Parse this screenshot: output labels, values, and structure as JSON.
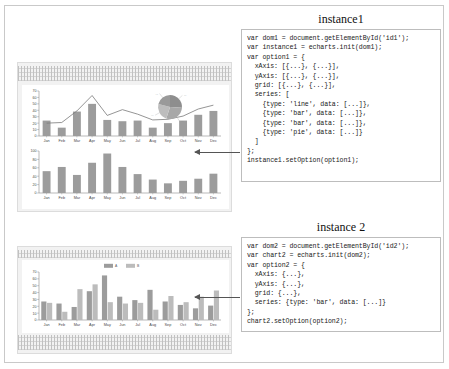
{
  "instances": [
    {
      "title": "instance1",
      "code": "var dom1 = document.getElementById('id1');\nvar instance1 = echarts.init(dom1);\nvar option1 = {\n  xAxis: [{...}, {...}],\n  yAxis: [{...}, {...}],\n  grid: [{...}, {...}],\n  series: [\n    {type: 'line', data: [...]},\n    {type: 'bar', data: [...]},\n    {type: 'bar', data: [...]},\n    {type: 'pie', data: [...]}\n  ]\n};\ninstance1.setOption(option1);"
    },
    {
      "title": "instance 2",
      "code": "var dom2 = document.getElementById('id2');\nvar chart2 = echarts.init(dom2);\nvar option2 = {\n  xAxis: {...},\n  yAxis: {...},\n  grid: {...},\n  series: {type: 'bar', data: [...]}\n};\nchart2.setOption(option2);"
    }
  ],
  "arrows": [
    {
      "name": "arrow-to-instance1-chart"
    },
    {
      "name": "arrow-to-instance2-chart"
    }
  ],
  "chart_data": [
    {
      "id": "instance1-upper",
      "type": "bar",
      "title": "",
      "xlabel": "",
      "ylabel": "",
      "categories": [
        "Jan",
        "Feb",
        "Mar",
        "Apr",
        "May",
        "Jun",
        "Jul",
        "Aug",
        "Sep",
        "Oct",
        "Nov",
        "Dec"
      ],
      "ytick_labels": [
        "0",
        "10",
        "20",
        "30",
        "40",
        "50",
        "60",
        "70"
      ],
      "ylim": [
        0,
        70
      ],
      "grid": false,
      "legend": "none",
      "series": [
        {
          "name": "bar",
          "type": "bar",
          "values": [
            24,
            13,
            38,
            50,
            25,
            23,
            24,
            13,
            20,
            24,
            33,
            39
          ]
        },
        {
          "name": "line",
          "type": "line",
          "values": [
            20,
            21,
            39,
            63,
            32,
            41,
            34,
            25,
            26,
            31,
            42,
            48
          ]
        }
      ],
      "pie": {
        "type": "pie",
        "values": [
          26,
          29,
          24,
          21
        ],
        "labels": [
          "...",
          "...",
          "...",
          "..."
        ]
      }
    },
    {
      "id": "instance1-lower",
      "type": "bar",
      "title": "",
      "xlabel": "",
      "ylabel": "",
      "categories": [
        "Jan",
        "Feb",
        "Mar",
        "Apr",
        "May",
        "Jun",
        "Jul",
        "Aug",
        "Sep",
        "Oct",
        "Nov",
        "Dec"
      ],
      "ytick_labels": [
        "0",
        "20",
        "40",
        "60",
        "80",
        "100"
      ],
      "ylim": [
        0,
        100
      ],
      "grid": false,
      "legend": "none",
      "series": [
        {
          "name": "bar",
          "type": "bar",
          "values": [
            52,
            62,
            43,
            72,
            94,
            62,
            45,
            32,
            23,
            29,
            34,
            46
          ]
        }
      ]
    },
    {
      "id": "instance2",
      "type": "bar",
      "title": "",
      "xlabel": "",
      "ylabel": "",
      "categories": [
        "Jan",
        "Feb",
        "Mar",
        "Apr",
        "May",
        "Jun",
        "Jul",
        "Aug",
        "Sep",
        "Oct",
        "Nov",
        "Dec"
      ],
      "ytick_labels": [
        "0",
        "10",
        "20",
        "30",
        "40",
        "50",
        "60",
        "70"
      ],
      "ylim": [
        0,
        70
      ],
      "grid": false,
      "legend_position": "top-center",
      "legend_entries": [
        "A",
        "B"
      ],
      "series": [
        {
          "name": "A",
          "type": "bar",
          "values": [
            27,
            24,
            19,
            42,
            65,
            34,
            29,
            44,
            27,
            22,
            17,
            21
          ]
        },
        {
          "name": "B",
          "type": "bar",
          "values": [
            25,
            12,
            45,
            52,
            26,
            24,
            25,
            15,
            35,
            26,
            34,
            43
          ]
        }
      ]
    }
  ]
}
